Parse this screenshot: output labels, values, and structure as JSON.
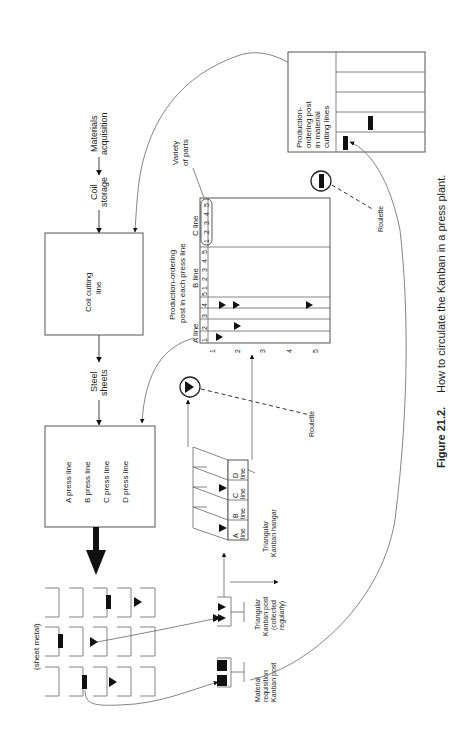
{
  "caption": {
    "label": "Figure 21.2.",
    "text": "How to circulate the Kanban in a press plant."
  },
  "flow": {
    "materials_acquisition": [
      "Materials",
      "acquisition"
    ],
    "coil_storage": [
      "Coil",
      "storage"
    ],
    "coil_cutting_line": [
      "Coil cutting",
      "line"
    ],
    "steel_sheets": [
      "Steel",
      "sheets"
    ],
    "press_lines": [
      "A press line",
      "B press line",
      "C press line",
      "D press line"
    ],
    "sheet_metal": "(sheet metal)"
  },
  "production_post": {
    "title": [
      "Production-ordering",
      "post in each press line"
    ],
    "lines": [
      {
        "label": "A line",
        "columns": [
          "1",
          "2",
          "3",
          "4",
          "5"
        ]
      },
      {
        "label": "B line",
        "columns": [
          "1",
          "2",
          "3",
          "4",
          "5"
        ]
      },
      {
        "label": "C line",
        "columns": [
          "1",
          "2",
          "3",
          "4",
          "5"
        ]
      }
    ],
    "row_labels": [
      "1",
      "2",
      "3",
      "4",
      "5"
    ],
    "variety_label": [
      "Variety",
      "of parts"
    ]
  },
  "material_cutting_post": {
    "title": [
      "Production-",
      "ordering post",
      "in material",
      "cutting lines"
    ]
  },
  "kanban_hangar": {
    "cells": [
      "A",
      "B",
      "C",
      "D"
    ],
    "cell_sub": "line",
    "label": [
      "Triangular",
      "Kanban hangar"
    ]
  },
  "triangular_post": {
    "label": [
      "Triangular",
      "Kanban post",
      "(collected",
      "regularly)"
    ]
  },
  "material_post": {
    "label": [
      "Material",
      "requisition",
      "Kanban post"
    ]
  },
  "roulette": {
    "label": "Roulette"
  }
}
